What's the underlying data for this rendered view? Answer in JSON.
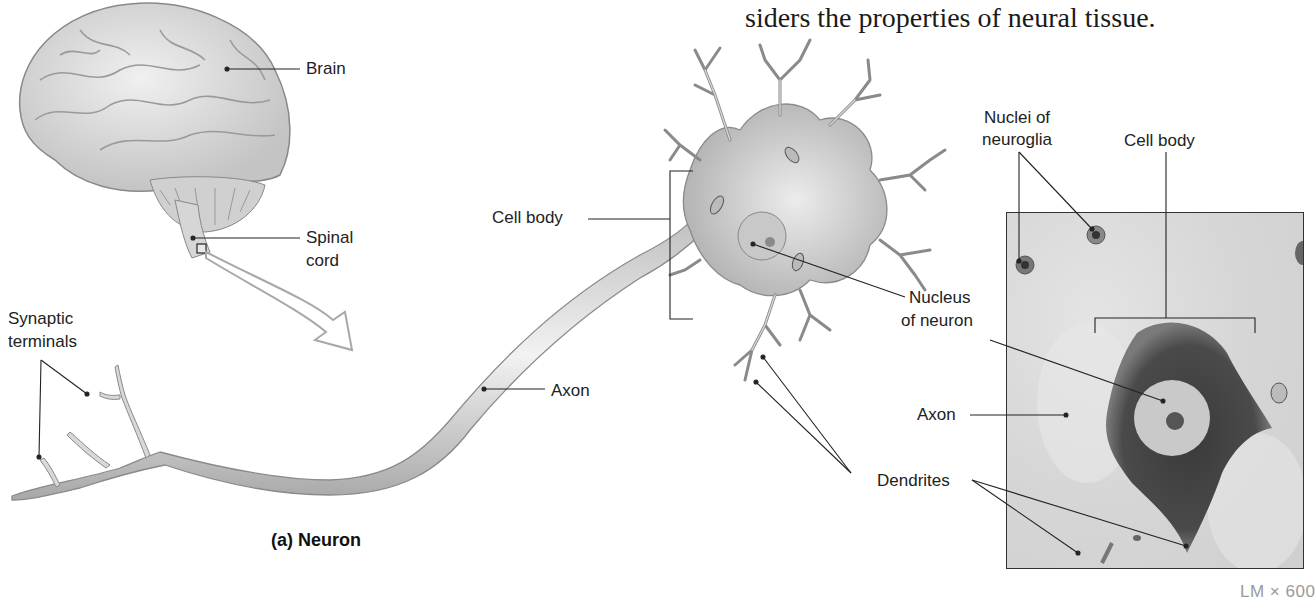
{
  "body_text": "siders the properties of neural tissue.",
  "figure": {
    "caption": "(a) Neuron",
    "magnification": "LM × 600"
  },
  "labels": {
    "brain": "Brain",
    "spinal_cord_1": "Spinal",
    "spinal_cord_2": "cord",
    "synaptic_terminals_1": "Synaptic",
    "synaptic_terminals_2": "terminals",
    "cell_body_left": "Cell body",
    "axon_left": "Axon",
    "nucleus_1": "Nucleus",
    "nucleus_2": "of neuron",
    "dendrites": "Dendrites",
    "axon_right": "Axon",
    "nuclei_neuroglia_1": "Nuclei of",
    "nuclei_neuroglia_2": "neuroglia",
    "cell_body_right": "Cell body"
  },
  "icons": {
    "brain": "brain-illustration",
    "neuron": "neuron-illustration",
    "micrograph": "light-micrograph",
    "arrow": "enlargement-arrow"
  }
}
